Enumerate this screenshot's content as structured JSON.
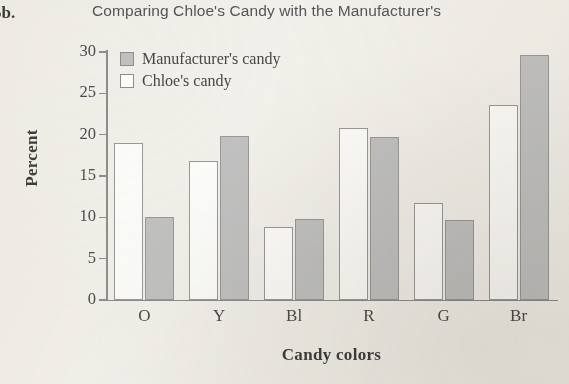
{
  "problem": {
    "number": "5b."
  },
  "chart_data": {
    "type": "bar",
    "title": "Comparing Chloe's Candy with the Manufacturer's",
    "xlabel": "Candy colors",
    "ylabel": "Percent",
    "categories": [
      "O",
      "Y",
      "Bl",
      "R",
      "G",
      "Br"
    ],
    "series": [
      {
        "name": "Chloe's candy",
        "values": [
          19.0,
          16.8,
          8.8,
          20.8,
          11.7,
          23.6
        ],
        "color": "#ffffff"
      },
      {
        "name": "Manufacturer's candy",
        "values": [
          10.0,
          19.9,
          9.8,
          19.7,
          9.7,
          29.6
        ],
        "color": "#c2c2c2"
      }
    ],
    "series_order_in_plot": [
      "Chloe's candy",
      "Manufacturer's candy"
    ],
    "ylim": [
      0,
      30
    ],
    "yticks": [
      "0",
      "5",
      "10",
      "15",
      "20",
      "25",
      "30"
    ],
    "grid": false,
    "legend_position": "top-left-inside",
    "legend_entries": [
      "Manufacturer's candy",
      "Chloe's candy"
    ]
  }
}
